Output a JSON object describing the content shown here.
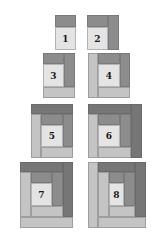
{
  "colors": {
    "dark": "#8c8c8c",
    "darker": "#767676",
    "light": "#c4c4c4",
    "center": "#e4e4e4"
  },
  "blocks": [
    {
      "label": "1",
      "x": 55,
      "y": 15,
      "strips": [
        {
          "t": "dark",
          "x": 0,
          "y": 0,
          "w": 21,
          "h": 12
        },
        {
          "t": "center",
          "x": 0,
          "y": 12,
          "w": 21,
          "h": 23,
          "num": true
        }
      ]
    },
    {
      "label": "2",
      "x": 87,
      "y": 15,
      "strips": [
        {
          "t": "dark",
          "x": 0,
          "y": 0,
          "w": 21,
          "h": 12
        },
        {
          "t": "dark",
          "x": 21,
          "y": 0,
          "w": 11,
          "h": 35
        },
        {
          "t": "center",
          "x": 0,
          "y": 12,
          "w": 21,
          "h": 23,
          "num": true
        }
      ]
    },
    {
      "label": "3",
      "x": 43,
      "y": 53,
      "strips": [
        {
          "t": "dark",
          "x": 0,
          "y": 0,
          "w": 21,
          "h": 11
        },
        {
          "t": "dark",
          "x": 21,
          "y": 0,
          "w": 11,
          "h": 34
        },
        {
          "t": "center",
          "x": 0,
          "y": 11,
          "w": 21,
          "h": 23,
          "num": true
        },
        {
          "t": "light",
          "x": 0,
          "y": 34,
          "w": 32,
          "h": 11
        }
      ]
    },
    {
      "label": "4",
      "x": 88,
      "y": 53,
      "strips": [
        {
          "t": "light",
          "x": 0,
          "y": 0,
          "w": 10,
          "h": 45
        },
        {
          "t": "dark",
          "x": 10,
          "y": 0,
          "w": 22,
          "h": 11
        },
        {
          "t": "dark",
          "x": 32,
          "y": 0,
          "w": 10,
          "h": 34
        },
        {
          "t": "center",
          "x": 10,
          "y": 11,
          "w": 22,
          "h": 23,
          "num": true
        },
        {
          "t": "light",
          "x": 10,
          "y": 34,
          "w": 32,
          "h": 11
        }
      ]
    },
    {
      "label": "5",
      "x": 31,
      "y": 104,
      "strips": [
        {
          "t": "darker",
          "x": 0,
          "y": 0,
          "w": 42,
          "h": 10
        },
        {
          "t": "light",
          "x": 0,
          "y": 10,
          "w": 10,
          "h": 44
        },
        {
          "t": "dark",
          "x": 10,
          "y": 10,
          "w": 22,
          "h": 11
        },
        {
          "t": "dark",
          "x": 32,
          "y": 10,
          "w": 10,
          "h": 33
        },
        {
          "t": "center",
          "x": 10,
          "y": 21,
          "w": 22,
          "h": 22,
          "num": true
        },
        {
          "t": "light",
          "x": 10,
          "y": 43,
          "w": 32,
          "h": 11
        }
      ]
    },
    {
      "label": "6",
      "x": 88,
      "y": 104,
      "strips": [
        {
          "t": "darker",
          "x": 0,
          "y": 0,
          "w": 43,
          "h": 10
        },
        {
          "t": "darker",
          "x": 43,
          "y": 0,
          "w": 11,
          "h": 54
        },
        {
          "t": "light",
          "x": 0,
          "y": 10,
          "w": 10,
          "h": 44
        },
        {
          "t": "dark",
          "x": 10,
          "y": 10,
          "w": 22,
          "h": 11
        },
        {
          "t": "dark",
          "x": 32,
          "y": 10,
          "w": 11,
          "h": 33
        },
        {
          "t": "center",
          "x": 10,
          "y": 21,
          "w": 22,
          "h": 22,
          "num": true
        },
        {
          "t": "light",
          "x": 10,
          "y": 43,
          "w": 33,
          "h": 11
        }
      ]
    },
    {
      "label": "7",
      "x": 20,
      "y": 162,
      "strips": [
        {
          "t": "darker",
          "x": 0,
          "y": 0,
          "w": 43,
          "h": 10
        },
        {
          "t": "darker",
          "x": 43,
          "y": 0,
          "w": 10,
          "h": 55
        },
        {
          "t": "light",
          "x": 0,
          "y": 10,
          "w": 11,
          "h": 45
        },
        {
          "t": "dark",
          "x": 11,
          "y": 10,
          "w": 21,
          "h": 11
        },
        {
          "t": "dark",
          "x": 32,
          "y": 10,
          "w": 11,
          "h": 34
        },
        {
          "t": "center",
          "x": 11,
          "y": 21,
          "w": 21,
          "h": 23,
          "num": true
        },
        {
          "t": "light",
          "x": 11,
          "y": 44,
          "w": 32,
          "h": 11
        },
        {
          "t": "light",
          "x": 0,
          "y": 55,
          "w": 53,
          "h": 11
        }
      ]
    },
    {
      "label": "8",
      "x": 88,
      "y": 162,
      "strips": [
        {
          "t": "light",
          "x": 0,
          "y": 0,
          "w": 10,
          "h": 66
        },
        {
          "t": "darker",
          "x": 10,
          "y": 0,
          "w": 37,
          "h": 10
        },
        {
          "t": "darker",
          "x": 47,
          "y": 0,
          "w": 11,
          "h": 55
        },
        {
          "t": "light",
          "x": 10,
          "y": 10,
          "w": 11,
          "h": 45
        },
        {
          "t": "dark",
          "x": 21,
          "y": 10,
          "w": 15,
          "h": 11
        },
        {
          "t": "dark",
          "x": 36,
          "y": 10,
          "w": 11,
          "h": 34
        },
        {
          "t": "center",
          "x": 21,
          "y": 21,
          "w": 15,
          "h": 23,
          "num": true
        },
        {
          "t": "light",
          "x": 21,
          "y": 44,
          "w": 26,
          "h": 11
        },
        {
          "t": "light",
          "x": 10,
          "y": 55,
          "w": 48,
          "h": 11
        }
      ]
    }
  ]
}
